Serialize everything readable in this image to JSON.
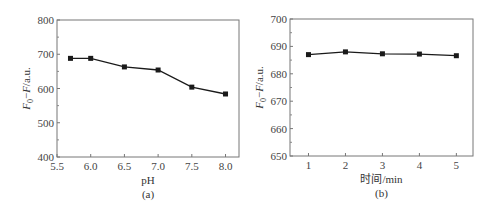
{
  "chart_data": [
    {
      "id": "a",
      "type": "line",
      "title": "",
      "caption": "(a)",
      "xlabel": "pH",
      "ylabel": "F0−F/a.u.",
      "ylabel_parts": {
        "main": "F",
        "sub": "0",
        "rest": "−F/a.u."
      },
      "xlim": [
        5.5,
        8.2
      ],
      "ylim": [
        400,
        800
      ],
      "xticks": [
        5.5,
        6.0,
        6.5,
        7.0,
        7.5,
        8.0
      ],
      "xtick_labels": [
        "5.5",
        "6.0",
        "6.5",
        "7.0",
        "7.5",
        "8.0"
      ],
      "yticks": [
        400,
        500,
        600,
        700,
        800
      ],
      "ytick_labels": [
        "400",
        "500",
        "600",
        "700",
        "800"
      ],
      "grid": false,
      "marker": "square",
      "color": "#1a1a1a",
      "x": [
        5.7,
        6.0,
        6.5,
        7.0,
        7.5,
        8.0
      ],
      "values": [
        688,
        688,
        663,
        654,
        604,
        584
      ]
    },
    {
      "id": "b",
      "type": "line",
      "title": "",
      "caption": "(b)",
      "xlabel": "时间/min",
      "ylabel": "F0−F/a.u.",
      "ylabel_parts": {
        "main": "F",
        "sub": "0",
        "rest": "−F/a.u."
      },
      "xlim": [
        0.5,
        5.45
      ],
      "ylim": [
        650,
        700
      ],
      "xticks": [
        1,
        2,
        3,
        4,
        5
      ],
      "xtick_labels": [
        "1",
        "2",
        "3",
        "4",
        "5"
      ],
      "yticks": [
        650,
        660,
        670,
        680,
        690,
        700
      ],
      "ytick_labels": [
        "650",
        "660",
        "670",
        "680",
        "690",
        "700"
      ],
      "grid": false,
      "marker": "square",
      "color": "#1a1a1a",
      "x": [
        1,
        2,
        3,
        4,
        5
      ],
      "values": [
        687.0,
        688.0,
        687.3,
        687.2,
        686.6
      ]
    }
  ]
}
